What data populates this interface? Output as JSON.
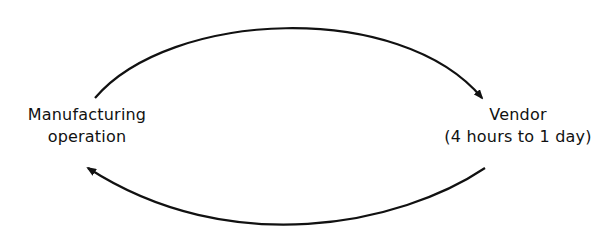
{
  "diagram": {
    "nodes": [
      {
        "id": "manufacturing",
        "lines": [
          "Manufacturing",
          "operation"
        ]
      },
      {
        "id": "vendor",
        "lines": [
          "Vendor",
          "(4 hours to 1 day)"
        ]
      }
    ],
    "edges": [
      {
        "from": "manufacturing",
        "to": "vendor",
        "route": "top-arc"
      },
      {
        "from": "vendor",
        "to": "manufacturing",
        "route": "bottom-arc"
      }
    ],
    "colors": {
      "line": "#111111",
      "background": "#ffffff"
    }
  }
}
